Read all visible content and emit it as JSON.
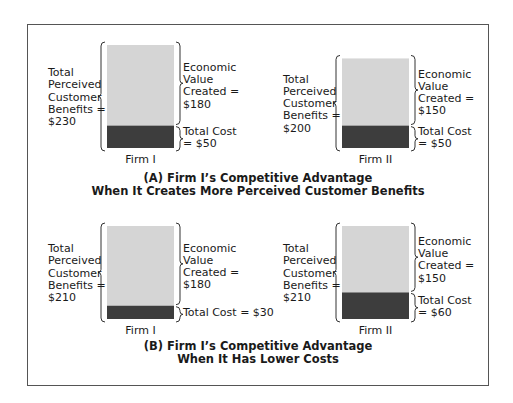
{
  "colors": {
    "benefit_fill": "#d5d5d5",
    "cost_fill": "#3d3d3d",
    "border": "#555555"
  },
  "panels": [
    {
      "id": "A",
      "caption_line1": "(A) Firm I’s Competitive Advantage",
      "caption_line2": "When It Creates More Perceived Customer Benefits",
      "firms": [
        {
          "name": "Firm I",
          "benefits": 230,
          "cost": 50,
          "value_created": 180,
          "benefits_label": [
            "Total",
            "Perceived",
            "Customer",
            "Benefits =",
            "$230"
          ],
          "value_label": [
            "Economic",
            "Value",
            "Created =",
            "$180"
          ],
          "cost_label": [
            "Total Cost",
            "= $50"
          ]
        },
        {
          "name": "Firm II",
          "benefits": 200,
          "cost": 50,
          "value_created": 150,
          "benefits_label": [
            "Total",
            "Perceived",
            "Customer",
            "Benefits =",
            "$200"
          ],
          "value_label": [
            "Economic",
            "Value",
            "Created =",
            "$150"
          ],
          "cost_label": [
            "Total Cost",
            "= $50"
          ]
        }
      ]
    },
    {
      "id": "B",
      "caption_line1": "(B) Firm I’s Competitive Advantage",
      "caption_line2": "When It Has Lower Costs",
      "firms": [
        {
          "name": "Firm I",
          "benefits": 210,
          "cost": 30,
          "value_created": 180,
          "benefits_label": [
            "Total",
            "Perceived",
            "Customer",
            "Benefits =",
            "$210"
          ],
          "value_label": [
            "Economic",
            "Value",
            "Created =",
            "$180"
          ],
          "cost_label": [
            "Total Cost = $30"
          ]
        },
        {
          "name": "Firm II",
          "benefits": 210,
          "cost": 60,
          "value_created": 150,
          "benefits_label": [
            "Total",
            "Perceived",
            "Customer",
            "Benefits =",
            "$210"
          ],
          "value_label": [
            "Economic",
            "Value",
            "Created =",
            "$150"
          ],
          "cost_label": [
            "Total Cost",
            "= $60"
          ]
        }
      ]
    }
  ]
}
